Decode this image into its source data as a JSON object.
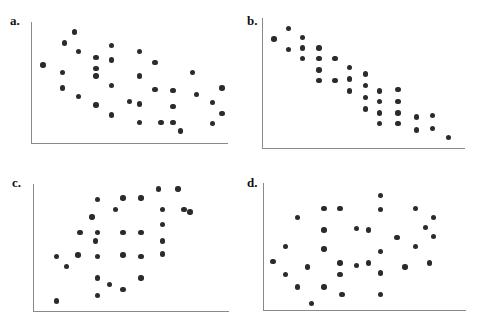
{
  "figure": {
    "width": 483,
    "height": 327,
    "background": "#ffffff",
    "dot_color": "#2b2b2f",
    "axis_color": "#8a8a8a",
    "label_color": "#111111"
  },
  "chart_data": [
    {
      "type": "scatter",
      "title": "a.",
      "label": "a.",
      "xlabel": "",
      "ylabel": "",
      "grid": false,
      "legend": "none",
      "description": "Negative linear association with moderate scatter",
      "xlim": [
        0,
        100
      ],
      "ylim": [
        0,
        100
      ],
      "points": [
        [
          6,
          64
        ],
        [
          17,
          82
        ],
        [
          22,
          91
        ],
        [
          24,
          75
        ],
        [
          16,
          58
        ],
        [
          16,
          45
        ],
        [
          24,
          38
        ],
        [
          33,
          70
        ],
        [
          33,
          61
        ],
        [
          33,
          55
        ],
        [
          33,
          31
        ],
        [
          41,
          80
        ],
        [
          41,
          68
        ],
        [
          41,
          47
        ],
        [
          41,
          23
        ],
        [
          50,
          34
        ],
        [
          55,
          75
        ],
        [
          55,
          55
        ],
        [
          55,
          32
        ],
        [
          55,
          17
        ],
        [
          63,
          66
        ],
        [
          63,
          44
        ],
        [
          66,
          17
        ],
        [
          72,
          43
        ],
        [
          72,
          30
        ],
        [
          72,
          17
        ],
        [
          76,
          10
        ],
        [
          82,
          58
        ],
        [
          84,
          40
        ],
        [
          92,
          33
        ],
        [
          92,
          16
        ],
        [
          97,
          45
        ],
        [
          97,
          24
        ]
      ]
    },
    {
      "type": "scatter",
      "title": "b.",
      "label": "b.",
      "xlabel": "",
      "ylabel": "",
      "grid": false,
      "legend": "none",
      "description": "Strong negative linear association, tight scatter",
      "xlim": [
        0,
        100
      ],
      "ylim": [
        0,
        100
      ],
      "points": [
        [
          6,
          84
        ],
        [
          13,
          92
        ],
        [
          13,
          76
        ],
        [
          20,
          85
        ],
        [
          20,
          77
        ],
        [
          20,
          69
        ],
        [
          28,
          77
        ],
        [
          28,
          69
        ],
        [
          28,
          60
        ],
        [
          28,
          52
        ],
        [
          36,
          69
        ],
        [
          36,
          52
        ],
        [
          43,
          62
        ],
        [
          43,
          53
        ],
        [
          43,
          44
        ],
        [
          51,
          57
        ],
        [
          51,
          48
        ],
        [
          51,
          39
        ],
        [
          51,
          30
        ],
        [
          58,
          44
        ],
        [
          58,
          36
        ],
        [
          58,
          27
        ],
        [
          58,
          19
        ],
        [
          67,
          45
        ],
        [
          67,
          36
        ],
        [
          67,
          27
        ],
        [
          67,
          19
        ],
        [
          76,
          24
        ],
        [
          76,
          14
        ],
        [
          84,
          25
        ],
        [
          84,
          15
        ],
        [
          92,
          8
        ]
      ]
    },
    {
      "type": "scatter",
      "title": "c.",
      "label": "c.",
      "xlabel": "",
      "ylabel": "",
      "grid": false,
      "legend": "none",
      "description": "Positive association with substantial scatter",
      "xlim": [
        0,
        100
      ],
      "ylim": [
        0,
        100
      ],
      "points": [
        [
          12,
          43
        ],
        [
          12,
          8
        ],
        [
          17,
          35
        ],
        [
          23,
          44
        ],
        [
          24,
          62
        ],
        [
          30,
          74
        ],
        [
          32,
          55
        ],
        [
          33,
          88
        ],
        [
          33,
          62
        ],
        [
          33,
          43
        ],
        [
          33,
          26
        ],
        [
          33,
          12
        ],
        [
          39,
          21
        ],
        [
          42,
          80
        ],
        [
          46,
          44
        ],
        [
          46,
          62
        ],
        [
          46,
          89
        ],
        [
          46,
          17
        ],
        [
          55,
          89
        ],
        [
          55,
          62
        ],
        [
          55,
          43
        ],
        [
          55,
          26
        ],
        [
          64,
          96
        ],
        [
          66,
          80
        ],
        [
          66,
          68
        ],
        [
          66,
          55
        ],
        [
          66,
          45
        ],
        [
          74,
          96
        ],
        [
          77,
          80
        ],
        [
          80,
          78
        ]
      ]
    },
    {
      "type": "scatter",
      "title": "d.",
      "label": "d.",
      "xlabel": "",
      "ylabel": "",
      "grid": false,
      "legend": "none",
      "description": "No apparent association, random scatter",
      "xlim": [
        0,
        100
      ],
      "ylim": [
        0,
        100
      ],
      "points": [
        [
          5,
          38
        ],
        [
          11,
          50
        ],
        [
          11,
          28
        ],
        [
          17,
          73
        ],
        [
          17,
          18
        ],
        [
          22,
          34
        ],
        [
          24,
          5
        ],
        [
          30,
          80
        ],
        [
          30,
          63
        ],
        [
          30,
          48
        ],
        [
          30,
          18
        ],
        [
          38,
          80
        ],
        [
          38,
          37
        ],
        [
          38,
          28
        ],
        [
          39,
          12
        ],
        [
          46,
          64
        ],
        [
          46,
          35
        ],
        [
          52,
          63
        ],
        [
          52,
          37
        ],
        [
          58,
          90
        ],
        [
          58,
          79
        ],
        [
          58,
          46
        ],
        [
          58,
          29
        ],
        [
          58,
          12
        ],
        [
          66,
          57
        ],
        [
          70,
          34
        ],
        [
          75,
          50
        ],
        [
          75,
          80
        ],
        [
          80,
          65
        ],
        [
          82,
          37
        ],
        [
          84,
          58
        ],
        [
          84,
          73
        ]
      ]
    }
  ],
  "panels": [
    {
      "id": "a",
      "label": "a.",
      "label_x": 10,
      "label_y": 14,
      "origin_x": 31,
      "origin_y": 143,
      "plot_width": 197,
      "plot_height": 122,
      "axis_top": 22
    },
    {
      "id": "b",
      "label": "b.",
      "label_x": 247,
      "label_y": 14,
      "origin_x": 262,
      "origin_y": 148,
      "plot_width": 203,
      "plot_height": 130,
      "axis_top": 18
    },
    {
      "id": "c",
      "label": "c.",
      "label_x": 12,
      "label_y": 176,
      "origin_x": 33,
      "origin_y": 311,
      "plot_width": 196,
      "plot_height": 127,
      "axis_top": 184
    },
    {
      "id": "d",
      "label": "d.",
      "label_x": 247,
      "label_y": 176,
      "origin_x": 263,
      "origin_y": 310,
      "plot_width": 203,
      "plot_height": 127,
      "axis_top": 183
    }
  ]
}
